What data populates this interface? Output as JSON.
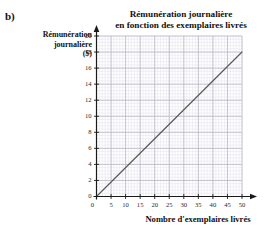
{
  "page": {
    "top_clipped_text": "",
    "exercise_label": "b)"
  },
  "chart_data": {
    "type": "line",
    "title": "Rémunération journalière en fonction des exemplaires livrés",
    "title_line1": "Rémunération journalière",
    "title_line2": "en fonction des exemplaires livrés",
    "xlabel": "Nombre d'exemplaires livrés",
    "ylabel": "Rémunération journalière ($)",
    "ylabel_line1": "Rémunération",
    "ylabel_line2": "journalière",
    "ylabel_line3": "($)",
    "xlim": [
      0,
      50
    ],
    "ylim": [
      0,
      20
    ],
    "xticks": [
      0,
      5,
      10,
      15,
      20,
      25,
      30,
      35,
      40,
      45,
      50
    ],
    "yticks": [
      0,
      2,
      4,
      6,
      8,
      10,
      12,
      14,
      16,
      18,
      20
    ],
    "grid": true,
    "grid_minor": true,
    "grid_major_step_x": 5,
    "grid_major_step_y": 2,
    "grid_minor_step_x": 1,
    "grid_minor_step_y": 0.4,
    "legend": null,
    "series": [
      {
        "name": "Rémunération",
        "x": [
          0,
          50
        ],
        "values": [
          0,
          18
        ],
        "slope": 0.36,
        "intercept": 0,
        "color": "#5a5a5a"
      }
    ],
    "colors": {
      "line": "#5a5a5a",
      "axis": "#1a1a1a",
      "grid_major": "#b9b9c4",
      "grid_minor": "#e4e4ec",
      "text": "#111111"
    }
  }
}
